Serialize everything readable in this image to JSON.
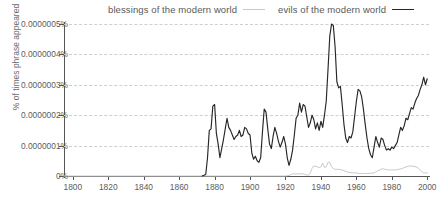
{
  "chart_data": {
    "type": "line",
    "title": "",
    "xlabel": "",
    "ylabel": "% of times phrase appeared",
    "xlim": [
      1795,
      2001
    ],
    "ylim": [
      0,
      5e-07
    ],
    "grid": true,
    "legend_position": "top",
    "y_tick_labels": [
      "0.0000005%",
      "0.0000004%",
      "0.0000003%",
      "0.0000002%",
      "0.0000001%",
      "0%"
    ],
    "y_tick_values": [
      5e-07,
      4e-07,
      3e-07,
      2e-07,
      1e-07,
      0
    ],
    "x_tick_labels": [
      "1800",
      "1820",
      "1840",
      "1860",
      "1880",
      "1900",
      "1920",
      "1940",
      "1960",
      "1980",
      "2000"
    ],
    "x_tick_values": [
      1800,
      1820,
      1840,
      1860,
      1880,
      1900,
      1920,
      1940,
      1960,
      1980,
      2000
    ],
    "colors": {
      "blessings": "#c9c9c9",
      "evils": "#262626"
    },
    "series": [
      {
        "name": "blessings of the modern world",
        "color": "#c9c9c9",
        "x": [
          1795,
          1860,
          1900,
          1905,
          1910,
          1915,
          1918,
          1920,
          1922,
          1924,
          1925,
          1926,
          1928,
          1930,
          1931,
          1932,
          1933,
          1934,
          1935,
          1936,
          1937,
          1938,
          1939,
          1940,
          1941,
          1942,
          1943,
          1944,
          1945,
          1946,
          1947,
          1948,
          1950,
          1952,
          1955,
          1958,
          1960,
          1962,
          1964,
          1965,
          1966,
          1968,
          1970,
          1972,
          1974,
          1975,
          1976,
          1978,
          1980,
          1982,
          1984,
          1986,
          1988,
          1990,
          1992,
          1994,
          1995,
          1996,
          1997,
          1998,
          1999,
          2000
        ],
        "values": [
          0,
          0,
          0,
          0,
          0,
          0,
          0,
          0,
          2e-09,
          7e-09,
          7e-09,
          7e-09,
          7e-09,
          7e-09,
          5e-09,
          3e-09,
          3e-09,
          1e-08,
          2.5e-08,
          3.3e-08,
          3.2e-08,
          3e-08,
          2.8e-08,
          3e-08,
          4.2e-08,
          2.8e-08,
          3e-08,
          4.5e-08,
          4.5e-08,
          3e-08,
          2.5e-08,
          2.2e-08,
          2.2e-08,
          2e-08,
          1.3e-08,
          1e-08,
          1e-08,
          8e-09,
          8e-09,
          8e-09,
          8e-09,
          9e-09,
          1e-08,
          1.7e-08,
          2.2e-08,
          2.4e-08,
          2.2e-08,
          2e-08,
          2e-08,
          2e-08,
          2.2e-08,
          2.5e-08,
          3e-08,
          3.3e-08,
          3.2e-08,
          3e-08,
          2.6e-08,
          2e-08,
          1.4e-08,
          1e-08,
          1e-08,
          1e-08
        ]
      },
      {
        "name": "evils of the modern world",
        "color": "#262626",
        "x": [
          1873,
          1875,
          1876,
          1877,
          1878,
          1879,
          1880,
          1881,
          1882,
          1883,
          1884,
          1885,
          1886,
          1887,
          1888,
          1889,
          1890,
          1891,
          1892,
          1893,
          1894,
          1895,
          1896,
          1897,
          1898,
          1899,
          1900,
          1901,
          1902,
          1903,
          1904,
          1905,
          1906,
          1907,
          1908,
          1909,
          1910,
          1911,
          1912,
          1913,
          1914,
          1915,
          1916,
          1917,
          1918,
          1919,
          1920,
          1921,
          1922,
          1923,
          1924,
          1925,
          1926,
          1927,
          1928,
          1929,
          1930,
          1931,
          1932,
          1933,
          1934,
          1935,
          1936,
          1937,
          1938,
          1939,
          1940,
          1941,
          1942,
          1943,
          1944,
          1945,
          1946,
          1947,
          1948,
          1949,
          1950,
          1951,
          1952,
          1953,
          1954,
          1955,
          1956,
          1957,
          1958,
          1959,
          1960,
          1961,
          1962,
          1963,
          1964,
          1965,
          1966,
          1967,
          1968,
          1969,
          1970,
          1971,
          1972,
          1973,
          1974,
          1975,
          1976,
          1977,
          1978,
          1979,
          1980,
          1981,
          1982,
          1983,
          1984,
          1985,
          1986,
          1987,
          1988,
          1989,
          1990,
          1991,
          1992,
          1993,
          1994,
          1995,
          1996,
          1997,
          1998,
          1999,
          2000
        ],
        "values": [
          0,
          5e-09,
          6e-08,
          1.5e-07,
          1.55e-07,
          2.3e-07,
          2.35e-07,
          1.4e-07,
          1.05e-07,
          6e-08,
          9e-08,
          1.2e-07,
          1.55e-07,
          1.9e-07,
          1.6e-07,
          1.5e-07,
          1.35e-07,
          1.2e-07,
          1.3e-07,
          1.35e-07,
          1.5e-07,
          1.3e-07,
          1.35e-07,
          1.6e-07,
          1.55e-07,
          1.4e-07,
          1.35e-07,
          7.5e-08,
          5.5e-08,
          6.5e-08,
          5e-08,
          4.5e-08,
          6e-08,
          1.45e-07,
          2.2e-07,
          2.1e-07,
          1.55e-07,
          1.05e-07,
          9e-08,
          1.3e-07,
          1.6e-07,
          1.4e-07,
          1.15e-07,
          9.5e-08,
          1.1e-07,
          1.3e-07,
          1.05e-07,
          6e-08,
          3.5e-08,
          5.5e-08,
          8.5e-08,
          1.35e-07,
          1.9e-07,
          2e-07,
          2.4e-07,
          2.1e-07,
          2.35e-07,
          2.3e-07,
          1.95e-07,
          1.6e-07,
          1.75e-07,
          2e-07,
          1.85e-07,
          1.55e-07,
          1.75e-07,
          1.5e-07,
          1.8e-07,
          1.6e-07,
          2e-07,
          2.45e-07,
          3.5e-07,
          4.6e-07,
          5e-07,
          4.95e-07,
          4.25e-07,
          3.1e-07,
          2.9e-07,
          2.95e-07,
          2.35e-07,
          1.7e-07,
          1.25e-07,
          1.1e-07,
          1.3e-07,
          1.25e-07,
          1.45e-07,
          1.95e-07,
          2.45e-07,
          2.85e-07,
          2.8e-07,
          2.6e-07,
          2.2e-07,
          1.7e-07,
          1.25e-07,
          9e-08,
          7e-08,
          6e-08,
          9.5e-08,
          1.3e-07,
          1.1e-07,
          9.5e-08,
          1.25e-07,
          1.2e-07,
          1e-07,
          8.5e-08,
          9e-08,
          8.5e-08,
          9.5e-08,
          9e-08,
          1e-07,
          1.1e-07,
          1.35e-07,
          1.6e-07,
          1.5e-07,
          1.65e-07,
          1.9e-07,
          1.85e-07,
          2.05e-07,
          2.25e-07,
          2.2e-07,
          2.4e-07,
          2.55e-07,
          2.65e-07,
          2.85e-07,
          3e-07,
          3.25e-07,
          3e-07,
          3.2e-07
        ]
      }
    ]
  }
}
